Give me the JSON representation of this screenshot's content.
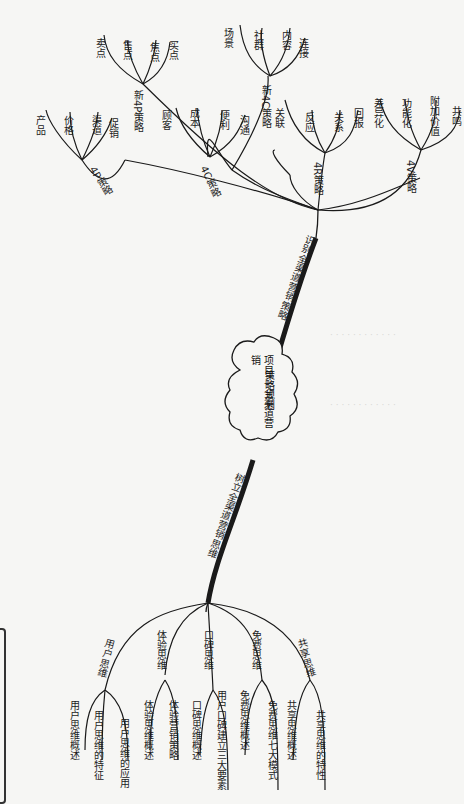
{
  "diagram": {
    "type": "mind-map",
    "center": {
      "line1": "项目二 全渠道营销",
      "line2": "策略规划"
    },
    "branches": [
      {
        "label": "识别全渠道营销策略",
        "children": [
          {
            "label": "4P策略",
            "children": [
              "产品",
              "价格",
              "渠道",
              "促销"
            ]
          },
          {
            "label": "新4P策略",
            "children": [
              "卖点",
              "售点",
              "焦点",
              "买点"
            ]
          },
          {
            "label": "4C策略",
            "children": [
              "顾客",
              "成本",
              "便利",
              "沟通"
            ]
          },
          {
            "label": "新4C策略",
            "children": [
              "场景",
              "社群",
              "内容",
              "连接"
            ]
          },
          {
            "label": "4R策略",
            "children": [
              "关联",
              "反应",
              "关系",
              "回报"
            ]
          },
          {
            "label": "4V策略",
            "children": [
              "差异化",
              "功能化",
              "附加价值",
              "共鸣"
            ]
          }
        ]
      },
      {
        "label": "树立全渠道营销思维",
        "children": [
          {
            "label": "用户思维",
            "children": [
              "用户思维概述",
              "用户思维的特征",
              "用户思维的应用"
            ]
          },
          {
            "label": "体验思维",
            "children": [
              "体验思维概述",
              "体验营销策略"
            ]
          },
          {
            "label": "口碑思维",
            "children": [
              "口碑思维概述",
              "用户口碑建立三大要素"
            ]
          },
          {
            "label": "免费思维",
            "children": [
              "免费思维概述",
              "免费思维七大模式"
            ]
          },
          {
            "label": "共享思维",
            "children": [
              "共享思维概述",
              "共享思维的特性"
            ]
          }
        ]
      }
    ]
  },
  "colors": {
    "paper": "#f6f6f4",
    "ink": "#1a1a1a"
  }
}
